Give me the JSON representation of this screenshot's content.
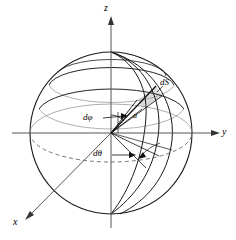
{
  "figure": {
    "type": "geometry-diagram",
    "width": 236,
    "height": 240,
    "background": "#ffffff",
    "stroke_color": "#000000",
    "patch_fill": "#d9d9d9",
    "dashed_color": "#555555"
  },
  "axes": {
    "z": {
      "label": "z",
      "direction": "up"
    },
    "y": {
      "label": "y",
      "direction": "right"
    },
    "x": {
      "label": "x",
      "direction": "lower-left"
    }
  },
  "labels": {
    "radius": "a",
    "d_phi": "dφ",
    "d_theta": "dθ",
    "d_surface": "dS"
  },
  "sphere": {
    "center_x": 111,
    "center_y": 133,
    "radius": 81,
    "equator_style": "dashed",
    "latitude_circles": 2,
    "meridian_curves": 3
  }
}
